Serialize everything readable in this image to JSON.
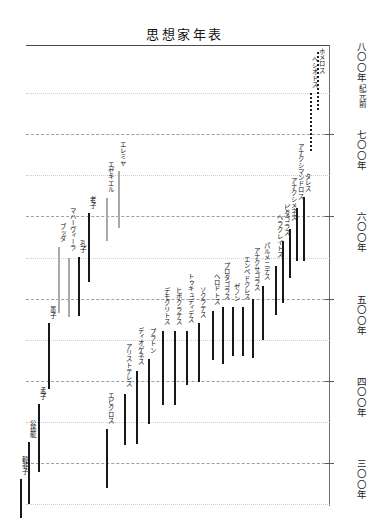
{
  "title": "思想家年表",
  "axis": {
    "era_prefix": "紀元前",
    "unit_suffix": "年",
    "ticks": [
      {
        "value": 800,
        "label": "八〇〇",
        "full": "紀元前八〇〇年",
        "major": true
      },
      {
        "value": 700,
        "label": "七〇〇",
        "full": "七〇〇年",
        "major": true
      },
      {
        "value": 600,
        "label": "六〇〇",
        "full": "六〇〇年",
        "major": true
      },
      {
        "value": 500,
        "label": "五〇〇",
        "full": "五〇〇年",
        "major": true
      },
      {
        "value": 400,
        "label": "四〇〇",
        "full": "四〇〇年",
        "major": true
      },
      {
        "value": 300,
        "label": "三〇〇",
        "full": "三〇〇年",
        "major": true
      }
    ],
    "minor_ticks": [
      750,
      650,
      550,
      450,
      350,
      250
    ],
    "range_top": 830,
    "range_bottom": 240
  },
  "chart_data": {
    "type": "bar",
    "orientation": "vertical-timeline",
    "title": "思想家年表",
    "xlabel": "",
    "ylabel": "紀元前(年)",
    "ylim": [
      830,
      240
    ],
    "grid": true,
    "legend": "none",
    "note": "Horizontal position = ordering only; vertical extent = lifespan in years BC (larger number = earlier).",
    "categories": [
      "ホメロス",
      "ヘシオドス",
      "エレミヤ",
      "エゼキエル",
      "タレス",
      "アナクシマンドロス",
      "アナクシメネス",
      "ピタゴラス",
      "ヘラクレイトス",
      "パルメニデス",
      "アナクサゴラス",
      "エンペドクレス",
      "ゼノン",
      "プロタゴラス",
      "ヘロドトス",
      "ソクラテス",
      "トゥキュディデス",
      "ヒポクラテス",
      "デモクリトス",
      "プラトン",
      "ディオゲネス",
      "アリストテレス",
      "エピクロス",
      "老子",
      "孔子",
      "マハーヴィーラ",
      "ブッダ",
      "墨子",
      "孟子",
      "公孫龍",
      "韓非子"
    ],
    "people": [
      {
        "name": "ホメロス",
        "start": 800,
        "end": 730,
        "style": "dotted",
        "col": 317
      },
      {
        "name": "ヘシオドス",
        "start": 750,
        "end": 680,
        "style": "dotted",
        "col": 310
      },
      {
        "name": "タレス",
        "start": 624,
        "end": 546,
        "style": "solid",
        "col": 303
      },
      {
        "name": "アナクシマンドロス",
        "start": 610,
        "end": 546,
        "style": "solid",
        "col": 296
      },
      {
        "name": "アナクシメネス",
        "start": 585,
        "end": 525,
        "style": "solid",
        "col": 289
      },
      {
        "name": "ピタゴラス",
        "start": 570,
        "end": 495,
        "style": "solid",
        "col": 282
      },
      {
        "name": "ヘラクレイトス",
        "start": 540,
        "end": 480,
        "style": "solid",
        "col": 275
      },
      {
        "name": "パルメニデス",
        "start": 515,
        "end": 450,
        "style": "solid",
        "col": 262
      },
      {
        "name": "アナクサゴラス",
        "start": 500,
        "end": 428,
        "style": "solid",
        "col": 252
      },
      {
        "name": "エンペドクレス",
        "start": 490,
        "end": 430,
        "style": "solid",
        "col": 242
      },
      {
        "name": "ゼノン",
        "start": 490,
        "end": 430,
        "style": "solid",
        "col": 232
      },
      {
        "name": "プロタゴラス",
        "start": 490,
        "end": 420,
        "style": "solid",
        "col": 222
      },
      {
        "name": "ヘロドトス",
        "start": 485,
        "end": 425,
        "style": "solid",
        "col": 212
      },
      {
        "name": "ソクラテス",
        "start": 470,
        "end": 399,
        "style": "solid",
        "col": 198
      },
      {
        "name": "トゥキュディデス",
        "start": 460,
        "end": 395,
        "style": "solid",
        "col": 186
      },
      {
        "name": "ヒポクラテス",
        "start": 460,
        "end": 370,
        "style": "solid",
        "col": 174
      },
      {
        "name": "デモクリトス",
        "start": 460,
        "end": 370,
        "style": "solid",
        "col": 162
      },
      {
        "name": "プラトン",
        "start": 427,
        "end": 347,
        "style": "solid",
        "col": 148
      },
      {
        "name": "ディオゲネス",
        "start": 412,
        "end": 323,
        "style": "solid",
        "col": 136
      },
      {
        "name": "アリストテレス",
        "start": 384,
        "end": 322,
        "style": "solid",
        "col": 124
      },
      {
        "name": "エピクロス",
        "start": 341,
        "end": 270,
        "style": "solid",
        "col": 106
      },
      {
        "name": "老子",
        "start": 604,
        "end": 520,
        "style": "solid",
        "col": 88
      },
      {
        "name": "孔子",
        "start": 551,
        "end": 479,
        "style": "solid",
        "col": 78
      },
      {
        "name": "マハーヴィーラ",
        "start": 549,
        "end": 477,
        "style": "hollow",
        "col": 68
      },
      {
        "name": "ブッダ",
        "start": 563,
        "end": 483,
        "style": "hollow",
        "col": 58
      },
      {
        "name": "墨子",
        "start": 470,
        "end": 390,
        "style": "solid",
        "col": 48
      },
      {
        "name": "孟子",
        "start": 372,
        "end": 289,
        "style": "solid",
        "col": 38
      },
      {
        "name": "公孫龍",
        "start": 325,
        "end": 250,
        "style": "solid",
        "col": 28
      },
      {
        "name": "韓非子",
        "start": 280,
        "end": 233,
        "style": "solid",
        "col": 20
      }
    ],
    "hebrew_prophets": [
      {
        "name": "エレミヤ",
        "start": 655,
        "end": 586,
        "style": "hollow",
        "col": 118
      },
      {
        "name": "エゼキエル",
        "start": 622,
        "end": 570,
        "style": "hollow",
        "col": 106
      }
    ]
  }
}
